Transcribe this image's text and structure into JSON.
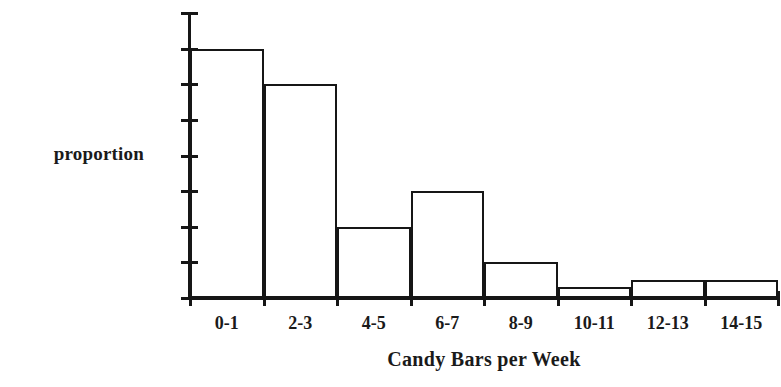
{
  "chart_data": {
    "type": "bar",
    "title": "",
    "subtitle": "",
    "xlabel": "Candy Bars per Week",
    "ylabel": "proportion",
    "categories": [
      "0-1",
      "2-3",
      "4-5",
      "6-7",
      "8-9",
      "10-11",
      "12-13",
      "14-15"
    ],
    "values": [
      0.35,
      0.3,
      0.1,
      0.15,
      0.05,
      0.015,
      0.025,
      0.025
    ],
    "ylim": [
      0,
      0.4
    ],
    "yticks": [
      0,
      0.05,
      0.1,
      0.15,
      0.2,
      0.25,
      0.3,
      0.35,
      0.4
    ],
    "ytick_labels": [
      "0",
      "0.05",
      "0.1",
      "0.15",
      "0.2",
      "0.25",
      "0.3",
      "0.35",
      "0.4"
    ],
    "grid": false,
    "legend": "none",
    "bar_style": "outline",
    "bar_gap": 0,
    "colors": {
      "ink": "#161616",
      "background": "#ffffff",
      "bar_fill": "transparent",
      "bar_stroke": "#161616"
    }
  }
}
